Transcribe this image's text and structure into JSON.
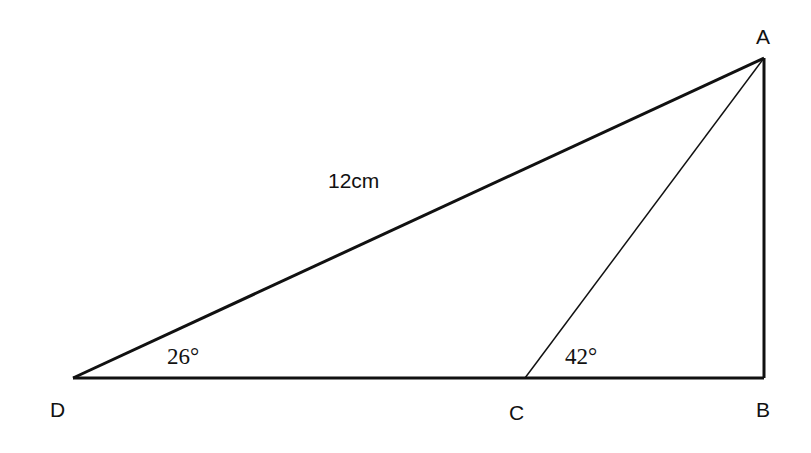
{
  "diagram": {
    "type": "geometry-triangle",
    "vertices": {
      "A": {
        "label": "A",
        "x": 764,
        "y": 58
      },
      "B": {
        "label": "B",
        "x": 764,
        "y": 378
      },
      "C": {
        "label": "C",
        "x": 525,
        "y": 378
      },
      "D": {
        "label": "D",
        "x": 73,
        "y": 378
      }
    },
    "segments": [
      {
        "from": "D",
        "to": "A",
        "length_label": "12cm"
      },
      {
        "from": "A",
        "to": "B"
      },
      {
        "from": "D",
        "to": "B"
      },
      {
        "from": "C",
        "to": "A"
      }
    ],
    "angles": {
      "D": "26°",
      "C": "42°"
    },
    "side_label": "12cm",
    "line_color": "#111111"
  }
}
